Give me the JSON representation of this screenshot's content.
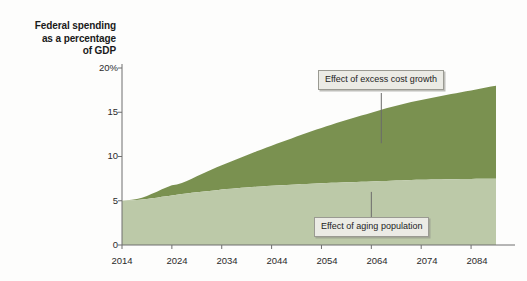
{
  "figure": {
    "axis_title_lines": [
      "Federal spending",
      "as a percentage",
      "of GDP"
    ],
    "axis_title_text": "Federal spending as a percentage of GDP"
  },
  "annotations": {
    "upper": "Effect of excess cost growth",
    "lower": "Effect of aging population"
  },
  "colors": {
    "excess_cost_growth": "#7a9150",
    "aging_population": "#bcc9a8",
    "axis": "#6e6e6e",
    "text": "#1a1a1a",
    "callout_fill": "#ebebe5",
    "callout_border": "#9a9a92",
    "background": "#fdfdfc"
  },
  "chart_data": {
    "type": "area",
    "title": "Federal spending as a percentage of GDP",
    "xlabel": "",
    "ylabel": "Federal spending as a percentage of GDP",
    "xlim": [
      2014,
      2089
    ],
    "ylim": [
      0,
      20
    ],
    "yticks": [
      0,
      5,
      10,
      15,
      20
    ],
    "ytick_labels": [
      "0",
      "5",
      "10",
      "15",
      "20%"
    ],
    "xticks": [
      2014,
      2024,
      2034,
      2044,
      2054,
      2064,
      2074,
      2084
    ],
    "xtick_labels": [
      "2014",
      "2024",
      "2034",
      "2044",
      "2054",
      "2064",
      "2074",
      "2084"
    ],
    "grid": false,
    "legend": "none",
    "stacked": true,
    "baseline": 5.0,
    "x": [
      2014,
      2015,
      2016,
      2017,
      2018,
      2019,
      2020,
      2021,
      2022,
      2023,
      2024,
      2025,
      2026,
      2027,
      2028,
      2029,
      2030,
      2031,
      2032,
      2033,
      2034,
      2035,
      2036,
      2037,
      2038,
      2039,
      2040,
      2041,
      2042,
      2043,
      2044,
      2045,
      2046,
      2047,
      2048,
      2049,
      2050,
      2051,
      2052,
      2053,
      2054,
      2055,
      2056,
      2057,
      2058,
      2059,
      2060,
      2061,
      2062,
      2063,
      2064,
      2065,
      2066,
      2067,
      2068,
      2069,
      2070,
      2071,
      2072,
      2073,
      2074,
      2075,
      2076,
      2077,
      2078,
      2079,
      2080,
      2081,
      2082,
      2083,
      2084,
      2085,
      2086,
      2087,
      2088,
      2089
    ],
    "series": [
      {
        "name": "Effect of aging population",
        "color": "#bcc9a8",
        "values": [
          5.0,
          5.02,
          5.05,
          5.08,
          5.13,
          5.2,
          5.28,
          5.35,
          5.44,
          5.52,
          5.6,
          5.68,
          5.76,
          5.83,
          5.9,
          5.96,
          6.02,
          6.08,
          6.14,
          6.2,
          6.26,
          6.32,
          6.37,
          6.42,
          6.46,
          6.5,
          6.54,
          6.58,
          6.62,
          6.66,
          6.7,
          6.73,
          6.76,
          6.79,
          6.82,
          6.85,
          6.88,
          6.9,
          6.93,
          6.95,
          6.98,
          7.0,
          7.02,
          7.04,
          7.06,
          7.08,
          7.1,
          7.12,
          7.14,
          7.16,
          7.18,
          7.2,
          7.22,
          7.24,
          7.26,
          7.28,
          7.3,
          7.32,
          7.34,
          7.36,
          7.37,
          7.38,
          7.39,
          7.4,
          7.41,
          7.42,
          7.43,
          7.44,
          7.45,
          7.46,
          7.47,
          7.48,
          7.49,
          7.49,
          7.5,
          7.5
        ]
      },
      {
        "name": "Effect of excess cost growth",
        "color": "#7a9150",
        "values": [
          0.0,
          0.03,
          0.07,
          0.12,
          0.2,
          0.33,
          0.5,
          0.68,
          0.85,
          1.0,
          1.15,
          1.15,
          1.25,
          1.4,
          1.6,
          1.8,
          2.0,
          2.2,
          2.4,
          2.58,
          2.75,
          2.92,
          3.1,
          3.28,
          3.46,
          3.64,
          3.82,
          4.0,
          4.18,
          4.35,
          4.52,
          4.7,
          4.88,
          5.05,
          5.22,
          5.4,
          5.58,
          5.75,
          5.92,
          6.1,
          6.25,
          6.42,
          6.58,
          6.75,
          6.9,
          7.05,
          7.2,
          7.35,
          7.5,
          7.62,
          7.75,
          7.9,
          8.05,
          8.2,
          8.32,
          8.45,
          8.58,
          8.7,
          8.82,
          8.92,
          9.02,
          9.12,
          9.22,
          9.32,
          9.42,
          9.52,
          9.62,
          9.72,
          9.82,
          9.92,
          10.0,
          10.1,
          10.2,
          10.3,
          10.4,
          10.5
        ]
      }
    ],
    "totals_note": {
      "start_total": 5.0,
      "end_total": 16.3,
      "end_aging": 7.5
    },
    "annotations": [
      {
        "text": "Effect of excess cost growth",
        "target_x": 2066,
        "target_y": 11.5
      },
      {
        "text": "Effect of aging population",
        "target_x": 2064,
        "target_y": 6.0
      }
    ]
  }
}
